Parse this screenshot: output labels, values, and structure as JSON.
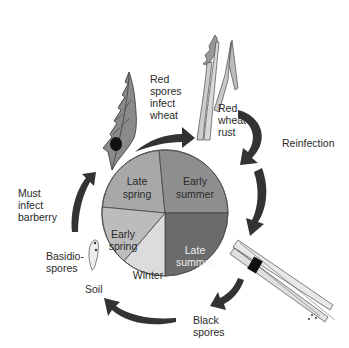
{
  "diagram": {
    "type": "life-cycle",
    "pie": {
      "segments": [
        {
          "label_lines": [
            "Late",
            "spring"
          ],
          "color": "#a8a8a8"
        },
        {
          "label_lines": [
            "Early",
            "summer"
          ],
          "color": "#8e8e8e"
        },
        {
          "label_lines": [
            "Late",
            "summer"
          ],
          "color": "#6b6b6b"
        },
        {
          "label_lines": [
            "Winter"
          ],
          "color": "#dcdcdc"
        },
        {
          "label_lines": [
            "Early",
            "spring"
          ],
          "color": "#bcbcbc"
        }
      ]
    },
    "labels": {
      "red_spores": [
        "Red",
        "spores",
        "infect",
        "wheat"
      ],
      "red_wheat_rust": [
        "Red",
        "wheat",
        "rust"
      ],
      "reinfection": [
        "Reinfection"
      ],
      "black_spores": [
        "Black",
        "spores"
      ],
      "soil": [
        "Soil"
      ],
      "basidiospores": [
        "Basidio-",
        "spores"
      ],
      "must_infect": [
        "Must",
        "infect",
        "barberry"
      ]
    },
    "illustrations": [
      "barberry-leaf",
      "wheat-plant",
      "wheat-stem",
      "basidiospore-germination"
    ],
    "colors": {
      "arrow": "#333333",
      "pie_outline": "#444444"
    }
  }
}
